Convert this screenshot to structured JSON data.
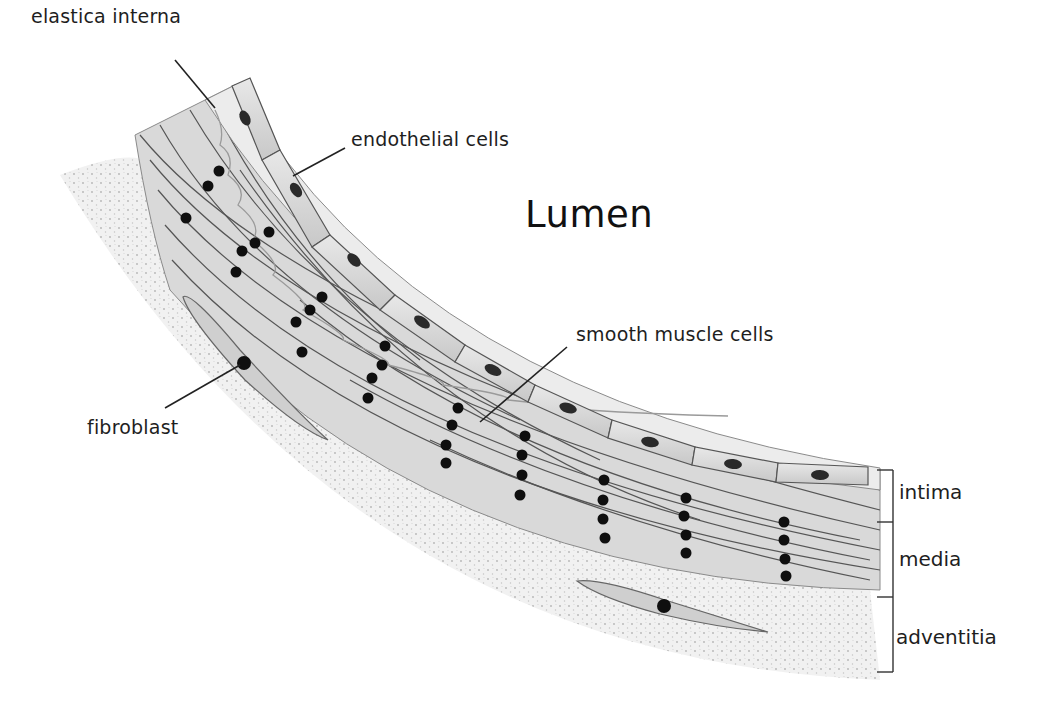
{
  "diagram": {
    "title": "Lumen",
    "type": "anatomical cross-section of an arterial wall",
    "labels": {
      "elastica_interna": "elastica interna",
      "endothelial_cells": "endothelial cells",
      "lumen": "Lumen",
      "smooth_muscle_cells": "smooth muscle cells",
      "fibroblast": "fibroblast"
    },
    "layers": [
      {
        "id": "intima",
        "label": "intima"
      },
      {
        "id": "media",
        "label": "media"
      },
      {
        "id": "adventitia",
        "label": "adventitia"
      }
    ],
    "colors": {
      "background": "#ffffff",
      "cell_fill": "#dcdcdc",
      "cell_stroke": "#555555",
      "nucleus": "#111111",
      "adventitia_fill": "#eeeeee",
      "text": "#1e1e1e"
    }
  }
}
